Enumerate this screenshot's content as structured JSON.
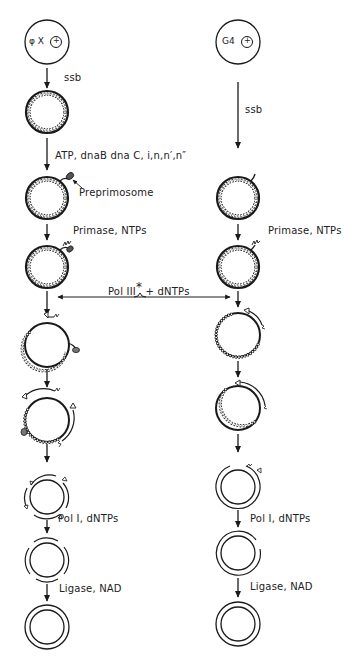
{
  "diagram": {
    "left_pathway": {
      "start_label": "φ X",
      "start_symbol": "+",
      "steps": [
        {
          "reagent": "ssb"
        },
        {
          "reagent": "ATP, dnaB dna C, i,n,n',n''"
        },
        {
          "reagent": "Primase, NTPs"
        },
        {
          "reagent": "Pol III* + dNTPs"
        },
        {
          "reagent": ""
        },
        {
          "reagent": ""
        },
        {
          "reagent": "Pol I, dNTPs"
        },
        {
          "reagent": "Ligase, NAD"
        }
      ],
      "annotation": "Preprimosome"
    },
    "right_pathway": {
      "start_label": "G4",
      "start_symbol": "+",
      "steps": [
        {
          "reagent": "ssb"
        },
        {
          "reagent": "Primase, NTPs"
        },
        {
          "reagent": "Pol III* + dNTPs"
        },
        {
          "reagent": ""
        },
        {
          "reagent": ""
        },
        {
          "reagent": "Pol I, dNTPs"
        },
        {
          "reagent": "Ligase, NAD"
        }
      ]
    },
    "labels": {
      "ssb_left": "ssb",
      "ssb_right": "ssb",
      "prepriming": "ATP, dnaB dna C, i,n,n′,n″",
      "preprimosome": "Preprimosome",
      "primase_left": "Primase, NTPs",
      "primase_right": "Primase, NTPs",
      "pol3": "Pol III",
      "pol3_star": "*",
      "pol3_rest": "+ dNTPs",
      "pol1_left": "Pol I, dNTPs",
      "pol1_right": "Pol I, dNTPs",
      "ligase_left": "Ligase, NAD",
      "ligase_right": "Ligase, NAD",
      "phix": "φ X",
      "g4": "G4",
      "plus": "+"
    },
    "colors": {
      "ink": "#1a1a1a",
      "background": "#ffffff"
    }
  }
}
